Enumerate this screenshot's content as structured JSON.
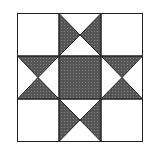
{
  "diagram": {
    "type": "quilt-block",
    "pattern": "ohio-star",
    "grid": "3x3",
    "colors": {
      "background": "#ffffff",
      "fill": "#555555",
      "dots": "#8a8a8a",
      "outline": "#222222"
    }
  }
}
